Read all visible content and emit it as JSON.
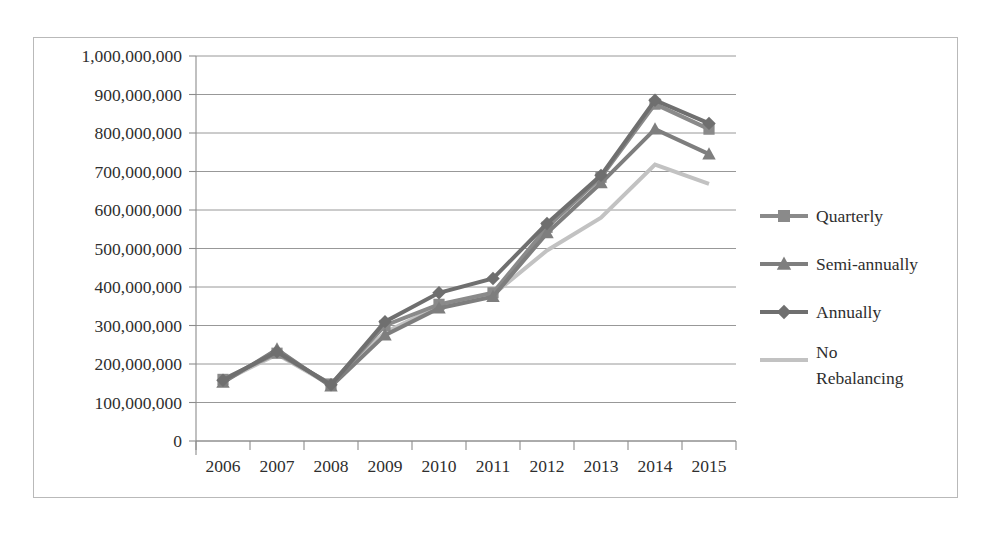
{
  "chart_data": {
    "type": "line",
    "title": "",
    "subtitle": "",
    "xlabel": "",
    "ylabel": "",
    "categories": [
      "2006",
      "2007",
      "2008",
      "2009",
      "2010",
      "2011",
      "2012",
      "2013",
      "2014",
      "2015"
    ],
    "ylim": [
      0,
      1000000000
    ],
    "ytick_step": 100000000,
    "ytick_labels": [
      "1,000,000,000",
      "900,000,000",
      "800,000,000",
      "700,000,000",
      "600,000,000",
      "500,000,000",
      "400,000,000",
      "300,000,000",
      "200,000,000",
      "100,000,000",
      "0"
    ],
    "ytick_values": [
      1000000000,
      900000000,
      800000000,
      700000000,
      600000000,
      500000000,
      400000000,
      300000000,
      200000000,
      100000000,
      0
    ],
    "grid": true,
    "grid_axis": "y",
    "legend_position": "right",
    "series": [
      {
        "name": "Quarterly",
        "marker": "square",
        "color": "#8a8a8a",
        "values": [
          160000000,
          228000000,
          148000000,
          300000000,
          355000000,
          385000000,
          555000000,
          685000000,
          875000000,
          810000000
        ]
      },
      {
        "name": "Semi-annually",
        "marker": "triangle",
        "color": "#7e7e7e",
        "values": [
          152000000,
          238000000,
          142000000,
          275000000,
          345000000,
          375000000,
          540000000,
          670000000,
          810000000,
          745000000
        ]
      },
      {
        "name": "Annually",
        "marker": "diamond",
        "color": "#6f6f6f",
        "values": [
          158000000,
          232000000,
          146000000,
          310000000,
          385000000,
          422000000,
          565000000,
          690000000,
          885000000,
          825000000
        ]
      },
      {
        "name": "No Rebalancing",
        "marker": "none",
        "color": "#c2c2c2",
        "values": [
          155000000,
          225000000,
          145000000,
          282000000,
          350000000,
          380000000,
          495000000,
          580000000,
          718000000,
          668000000
        ]
      }
    ]
  },
  "legend": {
    "entries": [
      {
        "label": "Quarterly",
        "label_line2": ""
      },
      {
        "label": "Semi-annually",
        "label_line2": ""
      },
      {
        "label": "Annually",
        "label_line2": ""
      },
      {
        "label": "No",
        "label_line2": "Rebalancing"
      }
    ]
  },
  "colors": {
    "frame": "#b9b9b9",
    "grid": "#8c8c8c",
    "axis": "#8c8c8c",
    "text": "#2e2e2e",
    "background": "#ffffff"
  }
}
